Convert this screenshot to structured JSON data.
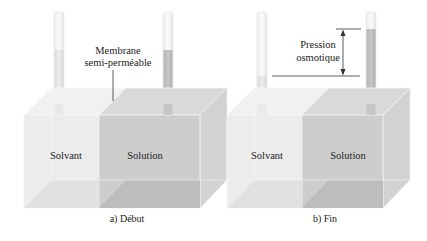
{
  "panels": [
    {
      "id": "a",
      "caption": "a) Début",
      "left_compartment": "Solvant",
      "right_compartment": "Solution",
      "annotation": {
        "line1": "Membrane",
        "line2": "semi-perméable"
      }
    },
    {
      "id": "b",
      "caption": "b) Fin",
      "left_compartment": "Solvant",
      "right_compartment": "Solution",
      "annotation": {
        "line1": "Pression",
        "line2": "osmotique"
      }
    }
  ],
  "colors": {
    "solvent": "#ececec",
    "solution": "#cfcfcf",
    "edge": "#f7f7f7",
    "text": "#222222"
  }
}
